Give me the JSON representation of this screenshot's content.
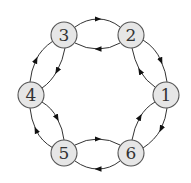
{
  "diagram": {
    "type": "directed-graph",
    "layout": "ring",
    "nodes": [
      {
        "id": "1",
        "label": "1",
        "x": 166,
        "y": 95
      },
      {
        "id": "2",
        "label": "2",
        "x": 131,
        "y": 35
      },
      {
        "id": "3",
        "label": "3",
        "x": 64,
        "y": 35
      },
      {
        "id": "4",
        "label": "4",
        "x": 31,
        "y": 95
      },
      {
        "id": "5",
        "label": "5",
        "x": 64,
        "y": 153
      },
      {
        "id": "6",
        "label": "6",
        "x": 131,
        "y": 153
      }
    ],
    "edges": [
      {
        "from": "3",
        "to": "2"
      },
      {
        "from": "2",
        "to": "3"
      },
      {
        "from": "2",
        "to": "1"
      },
      {
        "from": "1",
        "to": "2"
      },
      {
        "from": "1",
        "to": "6"
      },
      {
        "from": "6",
        "to": "1"
      },
      {
        "from": "5",
        "to": "6"
      },
      {
        "from": "6",
        "to": "5"
      },
      {
        "from": "4",
        "to": "5"
      },
      {
        "from": "5",
        "to": "4"
      },
      {
        "from": "4",
        "to": "3"
      },
      {
        "from": "3",
        "to": "4"
      }
    ],
    "colors": {
      "node_fill": "#e6e6e6",
      "node_stroke": "#555555",
      "edge": "#333333"
    }
  }
}
